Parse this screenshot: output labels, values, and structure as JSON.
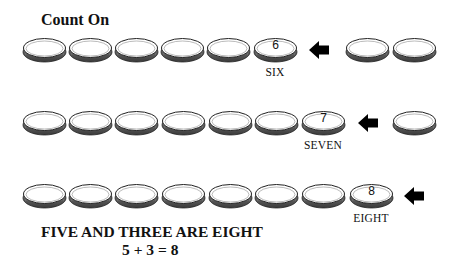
{
  "title": "Count On",
  "rows": [
    {
      "coins_before": 5,
      "highlight_number": "6",
      "highlight_label": "SIX",
      "coins_after": 2
    },
    {
      "coins_before": 6,
      "highlight_number": "7",
      "highlight_label": "SEVEN",
      "coins_after": 1
    },
    {
      "coins_before": 7,
      "highlight_number": "8",
      "highlight_label": "EIGHT",
      "coins_after": 0
    }
  ],
  "sentence": "FIVE AND THREE ARE EIGHT",
  "equation": "5 + 3 = 8",
  "icons": {
    "coin": "coin-icon",
    "arrow": "arrow-left-icon"
  },
  "colors": {
    "ink": "#111111",
    "coin_edge": "#555555",
    "background": "#ffffff"
  }
}
